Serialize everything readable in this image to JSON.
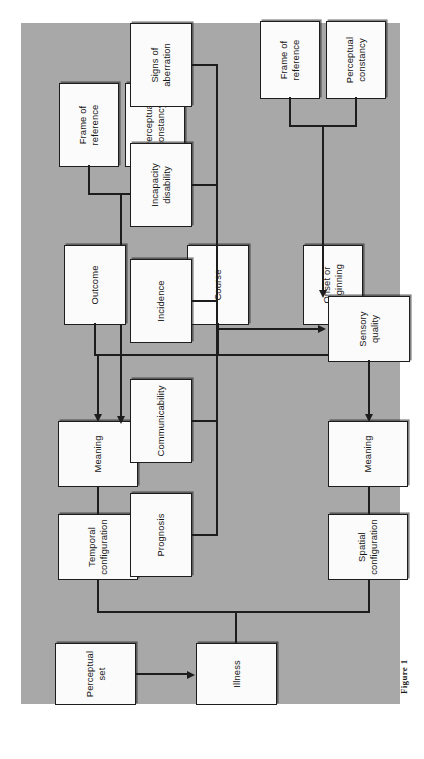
{
  "figure": {
    "caption": "Figure  1",
    "panel_color": "#a8a8a8",
    "node_fill": "#fbfbfb",
    "line_color": "#1d1d1d"
  },
  "nodes": {
    "perceptual_set": "Perceptual\nset",
    "illness": "Illness",
    "temporal_configuration": "Temporal\nconfiguration",
    "meaning_top": "Meaning",
    "frame_of_reference_top": "Frame of\nreference",
    "perceptual_constancy_top": "Perceptual\nconstancy",
    "onset_or_beginning": "Onset or\nbeginning",
    "course": "Course",
    "outcome": "Outcome",
    "spatial_configuration": "Spatial\nconfiguration",
    "meaning_bottom": "Meaning",
    "sensory_quality": "Sensory\nquality",
    "frame_of_reference_bottom": "Frame of\nreference",
    "perceptual_constancy_bottom": "Perceptual\nconstancy",
    "signs_of_aberration": "Signs of\naberration",
    "incapacity_disability": "Incapacity\ndisability",
    "incidence": "Incidence",
    "communicability": "Communicability",
    "prognosis": "Prognosis"
  },
  "chart_data": {
    "type": "diagram",
    "orientation": "rotated-90-counterclockwise",
    "title": "Figure  1",
    "boxes": [
      "Perceptual set",
      "Illness",
      "Temporal configuration",
      "Meaning",
      "Frame of reference",
      "Perceptual constancy",
      "Onset or beginning",
      "Course",
      "Outcome",
      "Spatial configuration",
      "Meaning",
      "Sensory quality",
      "Frame of reference",
      "Perceptual constancy",
      "Signs of aberration",
      "Incapacity disability",
      "Incidence",
      "Communicability",
      "Prognosis"
    ],
    "edges": [
      {
        "from": "Perceptual set",
        "to": "Illness",
        "arrow": true
      },
      {
        "from": "Illness",
        "to": "Temporal configuration",
        "arrow": false
      },
      {
        "from": "Illness",
        "to": "Spatial configuration",
        "arrow": false
      },
      {
        "from": "Temporal configuration",
        "to": "Meaning (top)",
        "arrow": false
      },
      {
        "from": "Frame of reference (top)",
        "to": "Meaning (top)",
        "arrow": true
      },
      {
        "from": "Perceptual constancy (top)",
        "to": "Meaning (top)",
        "arrow": true
      },
      {
        "from": "Onset or beginning",
        "to": "Meaning (top)",
        "arrow": true
      },
      {
        "from": "Course",
        "to": "Meaning (top)",
        "arrow": true
      },
      {
        "from": "Outcome",
        "to": "Meaning (top)",
        "arrow": true
      },
      {
        "from": "Spatial configuration",
        "to": "Meaning (bottom)",
        "arrow": false
      },
      {
        "from": "Sensory quality",
        "to": "Meaning (bottom)",
        "arrow": true
      },
      {
        "from": "Frame of reference (bottom)",
        "to": "Sensory quality",
        "arrow": true
      },
      {
        "from": "Perceptual constancy (bottom)",
        "to": "Sensory quality",
        "arrow": true
      },
      {
        "from": "Signs of aberration",
        "to": "Sensory quality",
        "arrow": true
      },
      {
        "from": "Incapacity disability",
        "to": "Sensory quality",
        "arrow": true
      },
      {
        "from": "Incidence",
        "to": "Sensory quality",
        "arrow": true
      },
      {
        "from": "Communicability",
        "to": "Sensory quality",
        "arrow": true
      },
      {
        "from": "Prognosis",
        "to": "Sensory quality",
        "arrow": true
      }
    ]
  }
}
